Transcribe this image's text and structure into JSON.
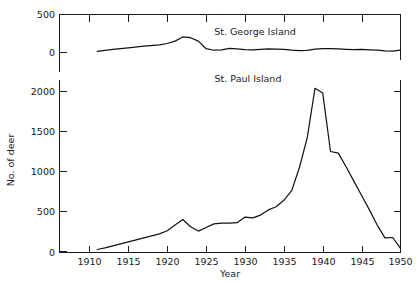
{
  "chart_data": {
    "type": "line",
    "title": "",
    "xlabel": "Year",
    "ylabel": "No. of deer",
    "grid": false,
    "legend_position": "inline-annotation",
    "broken_axis": true,
    "panels": [
      {
        "name": "upper",
        "series_name": "St. George Island",
        "annotation": "St. George Island",
        "ylim": [
          0,
          500
        ],
        "yticks": [
          0,
          500
        ],
        "ytick_labels": [
          "0",
          "500"
        ]
      },
      {
        "name": "lower",
        "series_name": "St. Paul Island",
        "annotation": "St. Paul Island",
        "ylim": [
          0,
          2250
        ],
        "yticks": [
          0,
          500,
          1000,
          1500,
          2000
        ],
        "ytick_labels": [
          "0",
          "500",
          "1000",
          "1500",
          "2000"
        ]
      }
    ],
    "xlim": [
      1907,
      1951
    ],
    "xticks": [
      1910,
      1915,
      1920,
      1925,
      1930,
      1935,
      1940,
      1945,
      1950
    ],
    "xtick_labels": [
      "1910",
      "1915",
      "1920",
      "1925",
      "1930",
      "1935",
      "1940",
      "1945",
      "1950"
    ],
    "series": [
      {
        "name": "St. George Island",
        "panel": "upper",
        "x": [
          1911,
          1913,
          1915,
          1917,
          1919,
          1920,
          1921,
          1922,
          1923,
          1924,
          1925,
          1926,
          1927,
          1928,
          1929,
          1930,
          1931,
          1932,
          1933,
          1934,
          1935,
          1936,
          1937,
          1938,
          1939,
          1940,
          1941,
          1942,
          1943,
          1944,
          1945,
          1946,
          1947,
          1948,
          1949,
          1950
        ],
        "values": [
          15,
          40,
          62,
          85,
          100,
          118,
          150,
          205,
          195,
          150,
          50,
          30,
          35,
          55,
          48,
          38,
          35,
          42,
          48,
          45,
          40,
          30,
          25,
          28,
          45,
          50,
          52,
          48,
          42,
          38,
          40,
          35,
          30,
          22,
          18,
          30
        ]
      },
      {
        "name": "St. Paul Island",
        "panel": "lower",
        "x": [
          1911,
          1912,
          1913,
          1914,
          1915,
          1916,
          1917,
          1918,
          1919,
          1920,
          1921,
          1922,
          1923,
          1924,
          1925,
          1926,
          1927,
          1928,
          1929,
          1930,
          1931,
          1932,
          1933,
          1934,
          1935,
          1936,
          1937,
          1938,
          1939,
          1940,
          1941,
          1942,
          1943,
          1944,
          1945,
          1946,
          1947,
          1948,
          1949,
          1950
        ],
        "values": [
          25,
          45,
          70,
          95,
          120,
          145,
          170,
          195,
          220,
          260,
          330,
          400,
          310,
          255,
          300,
          345,
          355,
          355,
          360,
          430,
          420,
          455,
          520,
          560,
          640,
          760,
          1050,
          1420,
          2040,
          1980,
          1250,
          1230,
          1060,
          880,
          700,
          520,
          330,
          170,
          175,
          40
        ]
      }
    ]
  },
  "labels": {
    "y_axis_title": "No. of deer",
    "x_axis_title": "Year",
    "upper_series_annotation": "St. George Island",
    "lower_series_annotation": "St. Paul Island",
    "upper_ytick_500": "500",
    "upper_ytick_0": "0",
    "lower_ytick_2000": "2000",
    "lower_ytick_1500": "1500",
    "lower_ytick_1000": "1000",
    "lower_ytick_500": "500",
    "lower_ytick_0": "0",
    "xtick_1910": "1910",
    "xtick_1915": "1915",
    "xtick_1920": "1920",
    "xtick_1925": "1925",
    "xtick_1930": "1930",
    "xtick_1935": "1935",
    "xtick_1940": "1940",
    "xtick_1945": "1945",
    "xtick_1950": "1950"
  },
  "colors": {
    "line": "#111111",
    "axis": "#1a1a1a",
    "background": "#ffffff"
  }
}
